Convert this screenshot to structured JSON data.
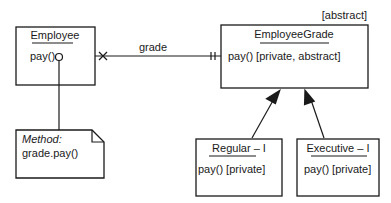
{
  "diagram": {
    "classes": {
      "employee": {
        "name": "Employee",
        "operation": "pay()"
      },
      "employee_grade": {
        "stereotype": "[abstract]",
        "name": "EmployeeGrade",
        "operation": "pay() [private, abstract]"
      },
      "regular": {
        "name": "Regular – I",
        "operation": "pay() [private]"
      },
      "executive": {
        "name": "Executive – I",
        "operation": "pay() [private]"
      }
    },
    "association": {
      "label": "grade"
    },
    "note": {
      "title": "Method:",
      "body": "grade.pay()"
    }
  }
}
